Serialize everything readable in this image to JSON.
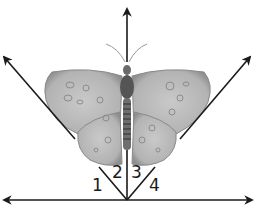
{
  "diagram": {
    "type": "angles-at-a-point",
    "vertex": {
      "x": 127,
      "y": 200
    },
    "rays": [
      {
        "name": "horizontal-left",
        "to": {
          "x": 3,
          "y": 200
        }
      },
      {
        "name": "horizontal-right",
        "to": {
          "x": 252,
          "y": 200
        }
      },
      {
        "name": "left-diagonal",
        "to": {
          "x": 3,
          "y": 56
        }
      },
      {
        "name": "vertical",
        "to": {
          "x": 127,
          "y": 8
        }
      },
      {
        "name": "right-diagonal",
        "to": {
          "x": 251,
          "y": 56
        }
      }
    ],
    "angle_labels": [
      {
        "label": "1",
        "x": 92,
        "y": 177
      },
      {
        "label": "2",
        "x": 112,
        "y": 164
      },
      {
        "label": "3",
        "x": 131,
        "y": 164
      },
      {
        "label": "4",
        "x": 149,
        "y": 177
      }
    ],
    "image": "butterfly",
    "colors": {
      "line": "#1a1a1a",
      "wing": "#b8b8b8",
      "wing_edge": "#8a8a8a",
      "body": "#555555"
    }
  }
}
